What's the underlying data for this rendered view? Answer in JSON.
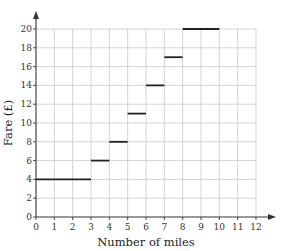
{
  "chart_data": {
    "type": "line",
    "subtype": "step",
    "title": "",
    "xlabel": "Number of miles",
    "ylabel": "Fare (£)",
    "xlim": [
      0,
      12
    ],
    "ylim": [
      0,
      20
    ],
    "x_ticks": [
      0,
      1,
      2,
      3,
      4,
      5,
      6,
      7,
      8,
      9,
      10,
      11,
      12
    ],
    "y_ticks": [
      0,
      2,
      4,
      6,
      8,
      10,
      12,
      14,
      16,
      18,
      20
    ],
    "grid": true,
    "legend": null,
    "segments": [
      {
        "x_start": 0,
        "x_end": 3,
        "y": 4
      },
      {
        "x_start": 3,
        "x_end": 4,
        "y": 6
      },
      {
        "x_start": 4,
        "x_end": 5,
        "y": 8
      },
      {
        "x_start": 5,
        "x_end": 6,
        "y": 11
      },
      {
        "x_start": 6,
        "x_end": 7,
        "y": 14
      },
      {
        "x_start": 7,
        "x_end": 8,
        "y": 17
      },
      {
        "x_start": 8,
        "x_end": 10,
        "y": 20
      }
    ]
  },
  "colors": {
    "grid": "#cfcfcf",
    "axis": "#333333",
    "segment": "#222222"
  }
}
